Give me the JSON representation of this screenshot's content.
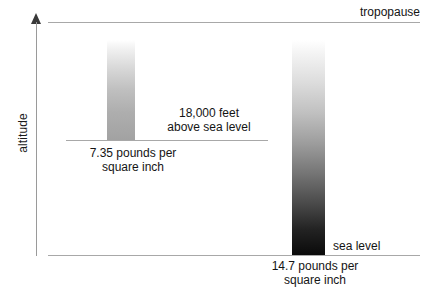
{
  "figure": {
    "background_color": "#ffffff",
    "width": 429,
    "height": 287
  },
  "axis": {
    "label": "altitude",
    "direction": "up",
    "arrow_icon": "up-arrow-icon",
    "color": "#9a9a9a"
  },
  "reference_lines": [
    {
      "name": "tropopause-line",
      "label": "tropopause",
      "color": "#a8a8a8"
    },
    {
      "name": "eighteen-thousand-feet-line",
      "label": "18,000 feet above sea level",
      "color": "#a8a8a8"
    },
    {
      "name": "sea-level-line",
      "label": "sea level",
      "color": "#a8a8a8"
    }
  ],
  "annotations": {
    "tropopause": "tropopause",
    "feet_line1": "18,000 feet",
    "feet_line2": "above sea level",
    "pressure_high_altitude_line1": "7.35 pounds per",
    "pressure_high_altitude_line2": "square inch",
    "sea_level": "sea level",
    "pressure_sea_level_line1": "14.7 pounds per",
    "pressure_sea_level_line2": "square inch"
  },
  "chart_data": {
    "type": "bar",
    "xlabel": "",
    "ylabel": "altitude",
    "grid": false,
    "legend": false,
    "orientation": "vertical",
    "categories": [
      "18,000 feet above sea level",
      "sea level"
    ],
    "values": [
      7.35,
      14.7
    ],
    "value_units": "pounds per square inch",
    "value_labels": [
      "7.35 pounds per square inch",
      "14.7 pounds per square inch"
    ],
    "bar_encoding": "vertical gradient column; darkness at base encodes air density / pressure",
    "bar_gradients": [
      {
        "category": "18,000 feet above sea level",
        "top_color": "#ffffff",
        "bottom_color": "#a2a2a2"
      },
      {
        "category": "sea level",
        "top_color": "#ffffff",
        "bottom_color": "#0a0a0a"
      }
    ],
    "reference_levels": [
      {
        "name": "tropopause",
        "label": "tropopause"
      },
      {
        "name": "18000ft",
        "label": "18,000 feet above sea level",
        "altitude_feet": 18000
      },
      {
        "name": "sea_level",
        "label": "sea level",
        "altitude_feet": 0
      }
    ],
    "ylim": [
      "sea level",
      "tropopause"
    ]
  }
}
